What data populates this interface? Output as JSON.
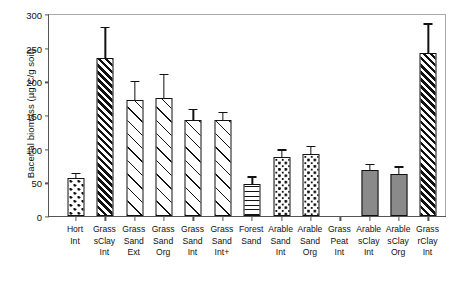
{
  "chart_data": {
    "type": "bar",
    "title": "",
    "xlabel": "",
    "ylabel": "Bacerial biomass (µg C/g soil)",
    "ylim": [
      0,
      300
    ],
    "yticks": [
      0,
      50,
      100,
      150,
      200,
      250,
      300
    ],
    "grid": false,
    "legend": "none",
    "categories": [
      "Hort Int",
      "Grass sClay Int",
      "Grass Sand Ext",
      "Grass Sand Org",
      "Grass Sand Int",
      "Grass Sand Int+",
      "Forest Sand",
      "Arable Sand Int",
      "Arable Sand Org",
      "Grass Peat Int",
      "Arable sClay Int",
      "Arable sClay Org",
      "Grass rClay Int"
    ],
    "category_lines": [
      [
        "Hort",
        "Int"
      ],
      [
        "Grass",
        "sClay",
        "Int"
      ],
      [
        "Grass",
        "Sand",
        "Ext"
      ],
      [
        "Grass",
        "Sand",
        "Org"
      ],
      [
        "Grass",
        "Sand",
        "Int"
      ],
      [
        "Grass",
        "Sand",
        "Int+"
      ],
      [
        "Forest",
        "Sand"
      ],
      [
        "Arable",
        "Sand",
        "Int"
      ],
      [
        "Arable",
        "Sand",
        "Org"
      ],
      [
        "Grass",
        "Peat",
        "Int"
      ],
      [
        "Arable",
        "sClay",
        "Int"
      ],
      [
        "Arable",
        "sClay",
        "Org"
      ],
      [
        "Grass",
        "rClay",
        "Int"
      ]
    ],
    "values": [
      56,
      235,
      172,
      176,
      143,
      143,
      48,
      88,
      92,
      null,
      68,
      63,
      242
    ],
    "errors": [
      6,
      44,
      27,
      33,
      14,
      10,
      9,
      9,
      10,
      null,
      8,
      9,
      42
    ],
    "fills": [
      "dots-sparse",
      "diag-dense",
      "diag-sparse",
      "diag-sparse",
      "diag-sparse",
      "diag-sparse",
      "horiz",
      "dots-dense",
      "dots-dense",
      "none",
      "gray",
      "gray",
      "diag-dense"
    ],
    "colors": {
      "bar_outline": "#111111",
      "gray_fill": "#8a8a8a",
      "axis": "#555555",
      "background": "#ffffff"
    }
  }
}
